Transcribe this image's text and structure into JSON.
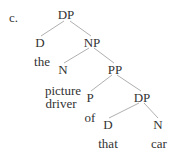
{
  "example_label": "c.",
  "tree": {
    "nodes": {
      "dp_root": "DP",
      "d_root": "D",
      "np": "NP",
      "n_head": "N",
      "pp": "PP",
      "p": "P",
      "dp_inner": "DP",
      "d_inner": "D",
      "n_inner": "N"
    },
    "leaves": {
      "the": "the",
      "picture": "picture",
      "driver": "driver",
      "of": "of",
      "that": "that",
      "car": "car"
    },
    "colors": {
      "text": "#333333",
      "edges": "#9a9a9a"
    }
  }
}
